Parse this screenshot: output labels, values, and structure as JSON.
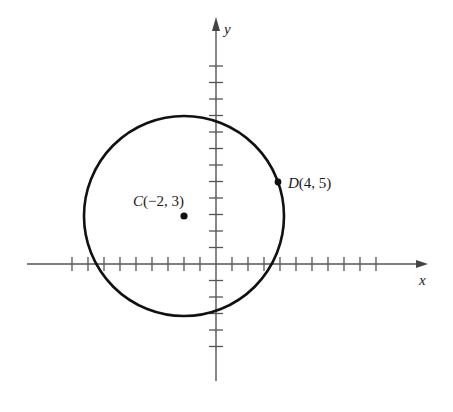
{
  "diagram": {
    "type": "coordinate-plane-circle",
    "axes": {
      "x_label": "x",
      "y_label": "y",
      "origin_px": [
        216,
        264
      ],
      "unit_px": 16.3,
      "x_ticks": [
        -9,
        -8,
        -7,
        -6,
        -5,
        -4,
        -3,
        -2,
        -1,
        1,
        2,
        3,
        4,
        5,
        6,
        7,
        8,
        9,
        10
      ],
      "y_ticks": [
        -5,
        -4,
        -3,
        -2,
        -1,
        1,
        2,
        3,
        4,
        5,
        6,
        7,
        8,
        9,
        10,
        11,
        12
      ]
    },
    "circle": {
      "center": [
        -2,
        3
      ],
      "through_point": [
        4,
        5
      ],
      "stroke_color": "#111111"
    },
    "points": [
      {
        "name": "C",
        "coords": "(−2, 3)",
        "x": -2,
        "y": 3
      },
      {
        "name": "D",
        "coords": "(4, 5)",
        "x": 4,
        "y": 5
      }
    ],
    "labels": {
      "C_name": "C",
      "C_coords": "(−2, 3)",
      "D_name": "D",
      "D_coords": "(4, 5)"
    },
    "colors": {
      "axis": "#555555",
      "circle": "#111111",
      "text": "#1a1a1a"
    }
  }
}
